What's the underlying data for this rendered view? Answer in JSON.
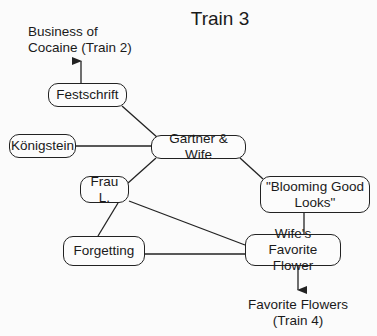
{
  "title": "Train 3",
  "nodes": {
    "festschrift": "Festschrift",
    "konigstein": "Königstein",
    "gartner": "Gartner & Wife",
    "frau": "Frau L.",
    "blooming_1": "\"Blooming Good",
    "blooming_2": "Looks\"",
    "forgetting": "Forgetting",
    "wife_flower_1": "Wife's Favorite",
    "wife_flower_2": "Flower"
  },
  "external": {
    "train2_1": "Business of",
    "train2_2": "Cocaine (Train 2)",
    "train4_1": "Favorite Flowers",
    "train4_2": "(Train 4)"
  },
  "edges": [
    [
      "Festschrift",
      "Gartner & Wife"
    ],
    [
      "Königstein",
      "Gartner & Wife"
    ],
    [
      "Gartner & Wife",
      "Frau L."
    ],
    [
      "Gartner & Wife",
      "\"Blooming Good Looks\""
    ],
    [
      "Frau L.",
      "Forgetting"
    ],
    [
      "Frau L.",
      "Wife's Favorite Flower"
    ],
    [
      "Forgetting",
      "Wife's Favorite Flower"
    ],
    [
      "\"Blooming Good Looks\"",
      "Wife's Favorite Flower"
    ],
    [
      "Festschrift",
      "Business of Cocaine (Train 2)",
      "arrow"
    ],
    [
      "Wife's Favorite Flower",
      "Favorite Flowers (Train 4)",
      "arrow"
    ]
  ]
}
